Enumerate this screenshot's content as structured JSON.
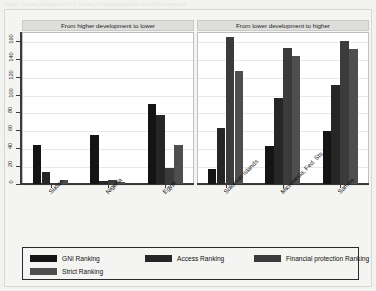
{
  "title_strip": "Figure: Country rankings by GNI, Access, Financial protection and Strict measures",
  "chart_data": {
    "type": "bar",
    "title": "",
    "xlabel": "",
    "ylabel": "",
    "ylim": [
      0,
      170
    ],
    "yticks": [
      0,
      20,
      40,
      60,
      80,
      100,
      120,
      140,
      160
    ],
    "ytick_labels": [
      "0",
      "20",
      "40",
      "60",
      "80",
      "100",
      "120",
      "140",
      "160"
    ],
    "grid": true,
    "legend_position": "bottom",
    "orientation": "vertical",
    "grouped": true,
    "panels": [
      {
        "header": "From higher development to lower",
        "categories": [
          "Sudan",
          "Nigeria",
          "Egypt"
        ],
        "series": [
          {
            "name": "GNI Ranking",
            "values": [
              44,
              55,
              90
            ]
          },
          {
            "name": "Access Ranking",
            "values": [
              13,
              3,
              77
            ]
          },
          {
            "name": "Financial protection Ranking",
            "values": [
              1,
              4,
              18
            ]
          },
          {
            "name": "Strict Ranking",
            "values": [
              5,
              2,
              44
            ]
          }
        ]
      },
      {
        "header": "From lower development to higher",
        "categories": [
          "Solomon Islands",
          "Micronesia, Fed. Sts.",
          "Samoa"
        ],
        "series": [
          {
            "name": "GNI Ranking",
            "values": [
              17,
              43,
              59
            ]
          },
          {
            "name": "Access Ranking",
            "values": [
              63,
              96,
              111
            ]
          },
          {
            "name": "Financial protection Ranking",
            "values": [
              164,
              152,
              160
            ]
          },
          {
            "name": "Strict Ranking",
            "values": [
              126,
              143,
              151
            ]
          }
        ]
      }
    ],
    "legend": [
      {
        "label": "GNI Ranking",
        "color": "#141414"
      },
      {
        "label": "Access Ranking",
        "color": "#262626"
      },
      {
        "label": "Financial protection Ranking",
        "color": "#3b3b3b"
      },
      {
        "label": "Strict Ranking",
        "color": "#4e4e4e"
      }
    ]
  }
}
